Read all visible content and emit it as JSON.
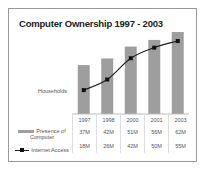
{
  "chart_data": {
    "type": "bar",
    "title": "Computer Ownership  1997 - 2003",
    "xlabel": "",
    "ylabel": "Households",
    "categories": [
      "1997",
      "1998",
      "2000",
      "2001",
      "2003"
    ],
    "series": [
      {
        "name": "Presence of Computer",
        "type": "bar",
        "color": "#9e9e9e",
        "values": [
          37,
          42,
          51,
          56,
          62
        ],
        "labels": [
          "37M",
          "42M",
          "51M",
          "56M",
          "62M"
        ]
      },
      {
        "name": "Internet Access",
        "type": "line",
        "color": "#111111",
        "values": [
          18,
          26,
          42,
          50,
          55
        ],
        "labels": [
          "18M",
          "26M",
          "42M",
          "50M",
          "55M"
        ]
      }
    ],
    "grid": false,
    "legend_position": "data-table-left",
    "units": "millions of households"
  },
  "legend": {
    "bar_label": "Presence of Computer",
    "line_label": "Internet Access"
  }
}
